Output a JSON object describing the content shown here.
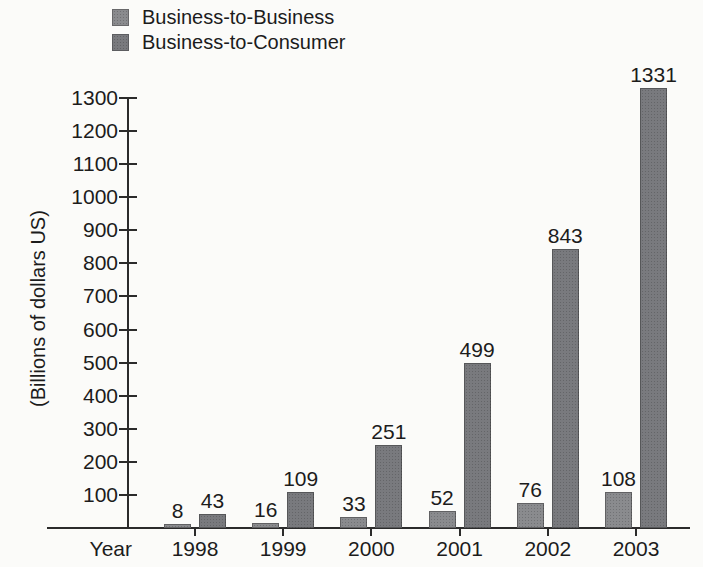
{
  "chart_data": {
    "type": "bar",
    "title": "",
    "categories": [
      "1998",
      "1999",
      "2000",
      "2001",
      "2002",
      "2003"
    ],
    "series": [
      {
        "key": "b2b",
        "name": "Business-to-Business",
        "color": "#8a8b8e",
        "values": [
          8,
          16,
          33,
          52,
          76,
          108
        ]
      },
      {
        "key": "b2c",
        "name": "Business-to-Consumer",
        "color": "#797a7e",
        "values": [
          43,
          109,
          251,
          499,
          843,
          1331
        ]
      }
    ],
    "xlabel": "Year",
    "ylabel": "(Billions of dollars US)",
    "ylim": [
      0,
      1300
    ],
    "ytick_step": 100,
    "yticks": [
      100,
      200,
      300,
      400,
      500,
      600,
      700,
      800,
      900,
      1000,
      1100,
      1200,
      1300
    ],
    "bar_value_labels": true,
    "legend_position": "top-left",
    "grid": false,
    "axis_color": "#2b2b2b",
    "text_color": "#1c1c1c",
    "background_color": "#fbfbf9"
  }
}
